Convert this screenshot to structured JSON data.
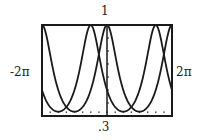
{
  "chart_data": {
    "type": "line",
    "title": "",
    "xlabel": "",
    "ylabel": "",
    "xlim": [
      -6.283185,
      6.283185
    ],
    "ylim": [
      0.3,
      1
    ],
    "x_tick_labels": {
      "left": "-2π",
      "right": "2π"
    },
    "y_tick_labels": {
      "top": "1",
      "bottom": ".3"
    },
    "x_tick_spacing": 0.785398,
    "grid": false,
    "legend": null,
    "series": [
      {
        "name": "y = 1/(2 - cos x)",
        "x": [
          -6.283,
          -5.498,
          -4.712,
          -3.927,
          -3.142,
          -2.356,
          -1.571,
          -0.785,
          0,
          0.785,
          1.571,
          2.356,
          3.142,
          3.927,
          4.712,
          5.498,
          6.283
        ],
        "values": [
          1.0,
          0.773,
          0.5,
          0.369,
          0.333,
          0.369,
          0.5,
          0.773,
          1.0,
          0.773,
          0.5,
          0.369,
          0.333,
          0.369,
          0.5,
          0.773,
          1.0
        ]
      },
      {
        "name": "y = 1/(2 + sin x)",
        "x": [
          -6.283,
          -5.498,
          -4.712,
          -3.927,
          -3.142,
          -2.356,
          -1.571,
          -0.785,
          0,
          0.785,
          1.571,
          2.356,
          3.142,
          3.927,
          4.712,
          5.498,
          6.283
        ],
        "values": [
          0.5,
          0.369,
          0.333,
          0.369,
          0.5,
          0.773,
          1.0,
          0.773,
          0.5,
          0.369,
          0.333,
          0.369,
          0.5,
          0.773,
          1.0,
          0.773,
          0.5
        ]
      }
    ]
  },
  "labels": {
    "top": "1",
    "bottom": ".3",
    "left": "-2π",
    "right": "2π"
  },
  "style": {
    "line_color": "#1a1a1a",
    "frame_color": "#1a1a1a"
  }
}
